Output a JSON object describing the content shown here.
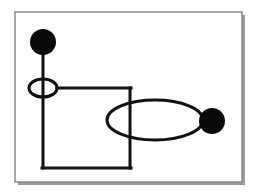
{
  "canvas": {
    "width": 255,
    "height": 196,
    "background": "#ffffff"
  },
  "colors": {
    "stroke": "#111111",
    "fill": "#0a0a0a",
    "frame": "#8a8a8a",
    "shadow": "#9a9a9a"
  },
  "frame": {
    "x": 15,
    "y": 12,
    "width": 227,
    "height": 170
  },
  "elements": {
    "top_dot": {
      "cx": 43,
      "cy": 42,
      "r": 13
    },
    "small_ellipse": {
      "cx": 43,
      "cy": 88,
      "rx": 14,
      "ry": 9
    },
    "large_ellipse": {
      "cx": 155,
      "cy": 120,
      "rx": 48,
      "ry": 20
    },
    "right_dot": {
      "cx": 212,
      "cy": 121,
      "r": 13
    },
    "stem_line": {
      "x1": 43,
      "y1": 54,
      "x2": 43,
      "y2": 168
    },
    "top_line": {
      "x1": 57,
      "y1": 88,
      "x2": 131,
      "y2": 88
    },
    "right_line": {
      "x1": 130,
      "y1": 88,
      "x2": 130,
      "y2": 168
    },
    "bottom_line": {
      "x1": 42,
      "y1": 168,
      "x2": 131,
      "y2": 168
    }
  }
}
